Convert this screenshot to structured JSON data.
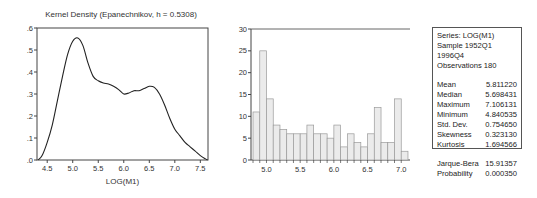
{
  "chart_data": [
    {
      "type": "line",
      "title": "Kernel Density (Epanechnikov, h = 0.5308)",
      "xlabel": "LOG(M1)",
      "ylabel": "",
      "xlim": [
        4.3,
        7.65
      ],
      "ylim": [
        0,
        0.6
      ],
      "x_ticks": [
        "4.5",
        "5.0",
        "5.5",
        "6.0",
        "6.5",
        "7.0",
        "7.5"
      ],
      "y_ticks": [
        ".0",
        ".1",
        ".2",
        ".3",
        ".4",
        ".5",
        ".6"
      ],
      "grid": false,
      "series": [
        {
          "name": "Kernel Density",
          "x": [
            4.32,
            4.4,
            4.5,
            4.6,
            4.7,
            4.8,
            4.9,
            5.0,
            5.1,
            5.2,
            5.3,
            5.4,
            5.5,
            5.6,
            5.7,
            5.8,
            5.9,
            6.0,
            6.1,
            6.2,
            6.3,
            6.4,
            6.5,
            6.6,
            6.7,
            6.8,
            6.9,
            7.0,
            7.1,
            7.2,
            7.3,
            7.4,
            7.5,
            7.6,
            7.64
          ],
          "y": [
            0.0,
            0.02,
            0.08,
            0.16,
            0.27,
            0.38,
            0.48,
            0.54,
            0.555,
            0.52,
            0.44,
            0.38,
            0.36,
            0.35,
            0.345,
            0.335,
            0.32,
            0.3,
            0.305,
            0.315,
            0.315,
            0.325,
            0.335,
            0.33,
            0.3,
            0.25,
            0.19,
            0.14,
            0.11,
            0.08,
            0.06,
            0.04,
            0.02,
            0.005,
            0.0
          ]
        }
      ]
    },
    {
      "type": "bar",
      "title": "",
      "xlabel": "",
      "ylabel": "",
      "ylim": [
        0,
        30
      ],
      "x_ticks": [
        "5.0",
        "5.5",
        "6.0",
        "6.5",
        "7.0"
      ],
      "y_ticks": [
        "0",
        "5",
        "10",
        "15",
        "20",
        "25",
        "30"
      ],
      "bin_start": 4.8,
      "bin_width": 0.1,
      "values": [
        11,
        25,
        14,
        8,
        7,
        6,
        6,
        6,
        8,
        6,
        6,
        5,
        8,
        3,
        6,
        4,
        3,
        6,
        12,
        4,
        4,
        14,
        2
      ]
    }
  ],
  "stats": {
    "series": "Series: LOG(M1)",
    "sample": "Sample 1952Q1 1996Q4",
    "observations": "Observations 180",
    "rows": [
      {
        "label": "Mean",
        "value": "5.811220"
      },
      {
        "label": "Median",
        "value": "5.698431"
      },
      {
        "label": "Maximum",
        "value": "7.106131"
      },
      {
        "label": "Minimum",
        "value": "4.840535"
      },
      {
        "label": "Std. Dev.",
        "value": "0.754650"
      },
      {
        "label": "Skewness",
        "value": "0.323130"
      },
      {
        "label": "Kurtosis",
        "value": "1.694566"
      }
    ],
    "jb_rows": [
      {
        "label": "Jarque-Bera",
        "value": "15.91357"
      },
      {
        "label": "Probability",
        "value": "0.000350"
      }
    ]
  }
}
